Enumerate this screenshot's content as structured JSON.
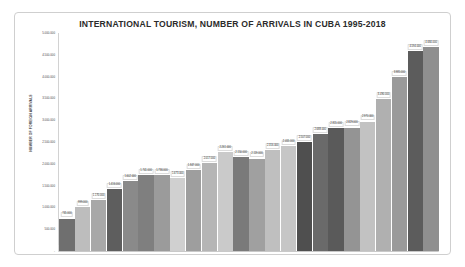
{
  "chart_data": {
    "type": "bar",
    "title": "INTERNATIONAL TOURISM, NUMBER OF ARRIVALS IN CUBA 1995-2018",
    "xlabel": "YEAR",
    "ylabel": "NUMBER OF FOREIGN ARRIVALS",
    "grid": false,
    "legend": "none",
    "ylim": [
      0,
      5000000
    ],
    "ytick_labels": [
      "-",
      "500.000",
      "1.000.000",
      "1.500.000",
      "2.000.000",
      "2.500.000",
      "3.000.000",
      "3.500.000",
      "4.000.000",
      "4.500.000",
      "5.000.000"
    ],
    "ytick_values": [
      0,
      500000,
      1000000,
      1500000,
      2000000,
      2500000,
      3000000,
      3500000,
      4000000,
      4500000,
      5000000
    ],
    "categories": [
      "1995",
      "1996",
      "1997",
      "1998",
      "1999",
      "2000",
      "2001",
      "2002",
      "2003",
      "2004",
      "2005",
      "2006",
      "2007",
      "2008",
      "2009",
      "2010",
      "2011",
      "2012",
      "2013",
      "2014",
      "2015",
      "2016",
      "2017",
      "2018"
    ],
    "values": [
      745000,
      999000,
      1170000,
      1416000,
      1602000,
      1741000,
      1736000,
      1673000,
      1847000,
      2017000,
      2261000,
      2150000,
      2119000,
      2316000,
      2405000,
      2507000,
      2688000,
      2815000,
      2829000,
      2970000,
      3490000,
      3985000,
      4594000,
      4684000
    ],
    "value_labels": [
      "745.000",
      "999.000",
      "1.170.000",
      "1.416.000",
      "1.602.000",
      "1.741.000",
      "1.736.000",
      "1.673.000",
      "1.847.000",
      "2.017.000",
      "2.261.000",
      "2.150.000",
      "2.119.000",
      "2.316.000",
      "2.405.000",
      "2.507.000",
      "2.688.000",
      "2.815.000",
      "2.829.000",
      "2.970.000",
      "3.490.000",
      "3.985.000",
      "4.594.000",
      "4.684.000"
    ],
    "bar_colors": [
      "#6f6f6f",
      "#bdbdbd",
      "#a8a8a8",
      "#5e5e5e",
      "#8a8a8a",
      "#7f7f7f",
      "#9b9b9b",
      "#d0d0d0",
      "#9e9e9e",
      "#b5b5b5",
      "#cacaca",
      "#7a7a7a",
      "#a0a0a0",
      "#bfbfbf",
      "#c6c6c6",
      "#4f4f4f",
      "#6a6a6a",
      "#5a5a5a",
      "#949494",
      "#c2c2c2",
      "#b0b0b0",
      "#9a9a9a",
      "#5c5c5c",
      "#8f8f8f"
    ]
  }
}
